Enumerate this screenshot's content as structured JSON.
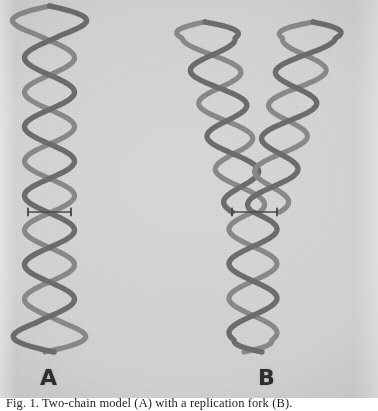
{
  "figure": {
    "kind": "photographic-plate",
    "title_visible": false,
    "background_color": "#d2d2d0",
    "strand_color": "#6d6d6b",
    "marker_color": "#4a4a48",
    "label_color": "#2e2e2c",
    "panels": [
      {
        "id": "A",
        "label": "A",
        "label_x": 40,
        "label_y": 365,
        "description": "unreplicated double helix with central marker clamp"
      },
      {
        "id": "B",
        "label": "B",
        "label_x": 258,
        "label_y": 365,
        "description": "replicating helix, two daughter helices splayed above the fork, marker clamp at the fork"
      }
    ],
    "caption": {
      "visible_fragment": "Fig. 1.  Two-chain model (A) with a replication fork (B).",
      "clipped": true
    }
  },
  "diagram_data": {
    "type": "line-drawing",
    "units": "pixels",
    "canvas": {
      "width": 378,
      "height": 398
    },
    "helix_A": {
      "center_x": 49.5,
      "amplitude": 25.0,
      "top_y": 6,
      "bottom_y": 352,
      "half_period": 34.5,
      "crossings_y": [
        20,
        54,
        89,
        123,
        158,
        192,
        227,
        261,
        296,
        330
      ],
      "splay_top": true,
      "splay_bottom": true,
      "marker": {
        "y": 212,
        "x1": 28,
        "x2": 71,
        "cap_height": 7
      }
    },
    "helix_B": {
      "fork_y": 212,
      "stem": {
        "center_x": 253,
        "amplitude": 24.0,
        "top_y": 212,
        "bottom_y": 352,
        "half_period": 34.5,
        "splay_bottom": true
      },
      "branch_left": {
        "top_center_x": 205,
        "bottom_center_x": 246,
        "amplitude_top": 27.0,
        "amplitude_bottom": 20.0,
        "top_y": 22,
        "bottom_y": 212,
        "half_period": 33.0,
        "splay_top": true
      },
      "branch_right": {
        "top_center_x": 313,
        "bottom_center_x": 266,
        "amplitude_top": 27.0,
        "amplitude_bottom": 20.0,
        "top_y": 22,
        "bottom_y": 212,
        "half_period": 33.0,
        "splay_top": true
      },
      "marker": {
        "y": 212,
        "x1": 232,
        "x2": 277,
        "cap_height": 7
      }
    }
  }
}
